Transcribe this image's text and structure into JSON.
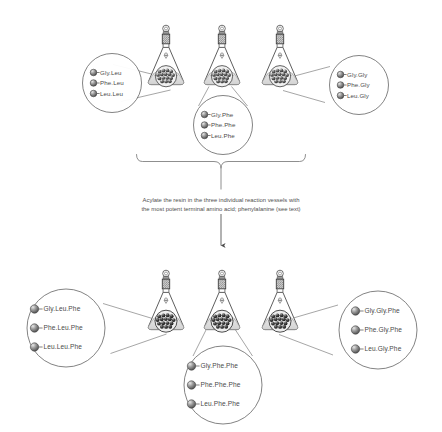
{
  "figure": {
    "caption_line1": "Acylate the resin in the three individual reaction vessels with",
    "caption_line2": "the most potent terminal amino acid; phenylalanine (see text)",
    "colors": {
      "outline": "#555555",
      "text": "#4a4a4a",
      "bead_dark": "#3f3f3f",
      "bead_light": "#bdbdbd",
      "liquid": "#d9d9d9",
      "stopper": "#6e6e6e"
    }
  },
  "top_stage": {
    "flasks": [
      {
        "name": "flask-top-left",
        "vessel_label": "reaction vessel 1"
      },
      {
        "name": "flask-top-center",
        "vessel_label": "reaction vessel 2"
      },
      {
        "name": "flask-top-right",
        "vessel_label": "reaction vessel 3"
      }
    ],
    "callouts": [
      {
        "name": "callout-top-left",
        "peptides": [
          "Gly.Leu",
          "Phe.Leu",
          "Leu.Leu"
        ]
      },
      {
        "name": "callout-top-center",
        "peptides": [
          "Gly.Phe",
          "Phe.Phe",
          "Leu.Phe"
        ]
      },
      {
        "name": "callout-top-right",
        "peptides": [
          "Gly.Gly",
          "Phe.Gly",
          "Leu.Gly"
        ]
      }
    ]
  },
  "bottom_stage": {
    "flasks": [
      {
        "name": "flask-bottom-left",
        "vessel_label": "reaction vessel 1"
      },
      {
        "name": "flask-bottom-center",
        "vessel_label": "reaction vessel 2"
      },
      {
        "name": "flask-bottom-right",
        "vessel_label": "reaction vessel 3"
      }
    ],
    "callouts": [
      {
        "name": "callout-bottom-left",
        "peptides": [
          "Gly.Leu.Phe",
          "Phe.Leu.Phe",
          "Leu.Leu.Phe"
        ]
      },
      {
        "name": "callout-bottom-center",
        "peptides": [
          "Gly.Phe.Phe",
          "Phe.Phe.Phe",
          "Leu.Phe.Phe"
        ]
      },
      {
        "name": "callout-bottom-right",
        "peptides": [
          "Gly.Gly.Phe",
          "Phe.Gly.Phe",
          "Leu.Gly.Phe"
        ]
      }
    ]
  }
}
